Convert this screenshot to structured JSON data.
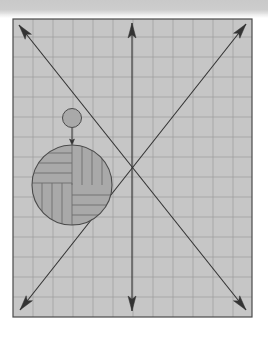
{
  "canvas": {
    "width": 268,
    "height": 342,
    "background": "#ffffff"
  },
  "top_band": {
    "height": 14,
    "color": "#cacaca"
  },
  "frame": {
    "x": 13,
    "y": 19,
    "width": 239,
    "height": 298,
    "fill": "#c6c6c6",
    "stroke": "#4a4a4a",
    "stroke_width": 1.2
  },
  "grid": {
    "spacing": 20,
    "origin_x": 13,
    "origin_y": 17,
    "color": "#9c9c9c",
    "line_width": 0.7
  },
  "arrows": {
    "color": "#333333",
    "line_width": 1.1,
    "head_length": 15,
    "head_width": 8,
    "origin": {
      "x": 132,
      "y": 168
    },
    "items": [
      {
        "name": "arrow-up-left",
        "tip": {
          "x": 19,
          "y": 25
        }
      },
      {
        "name": "arrow-up",
        "tip": {
          "x": 132,
          "y": 23
        }
      },
      {
        "name": "arrow-up-right",
        "tip": {
          "x": 246,
          "y": 24
        }
      },
      {
        "name": "arrow-down-left",
        "tip": {
          "x": 20,
          "y": 310
        }
      },
      {
        "name": "arrow-down",
        "tip": {
          "x": 132,
          "y": 311
        }
      },
      {
        "name": "arrow-down-right",
        "tip": {
          "x": 246,
          "y": 310
        }
      }
    ],
    "lines": [
      {
        "name": "diagonal-line-a",
        "from": {
          "x": 19,
          "y": 25
        },
        "to": {
          "x": 246,
          "y": 310
        }
      },
      {
        "name": "diagonal-line-b",
        "from": {
          "x": 246,
          "y": 24
        },
        "to": {
          "x": 20,
          "y": 310
        }
      },
      {
        "name": "vertical-line",
        "from": {
          "x": 132,
          "y": 23
        },
        "to": {
          "x": 132,
          "y": 311
        }
      }
    ]
  },
  "small_circle": {
    "cx": 72,
    "cy": 118,
    "r": 9.5,
    "fill": "#a9a9a9",
    "stroke": "#4a4a4a"
  },
  "connector_arrow": {
    "from": {
      "x": 72,
      "y": 128
    },
    "to": {
      "x": 72,
      "y": 145
    },
    "head_length": 6,
    "head_width": 5,
    "color": "#333333"
  },
  "large_circle": {
    "cx": 72,
    "cy": 185,
    "r": 40,
    "fill": "#a9a9a9",
    "stroke": "#4a4a4a",
    "stripe_color": "#6d6d6d",
    "stripe_spacing": 10,
    "quadrants": [
      {
        "name": "top-left",
        "orientation": "horizontal"
      },
      {
        "name": "top-right",
        "orientation": "vertical"
      },
      {
        "name": "bottom-left",
        "orientation": "vertical"
      },
      {
        "name": "bottom-right",
        "orientation": "horizontal"
      }
    ]
  }
}
